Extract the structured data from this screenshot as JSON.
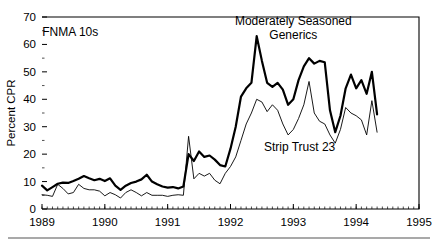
{
  "chart_data": {
    "type": "line",
    "title": "",
    "xlabel": "",
    "ylabel": "Percent CPR",
    "xlim": [
      1989.0,
      1995.0
    ],
    "ylim": [
      0,
      70
    ],
    "yticks": [
      0,
      10,
      20,
      30,
      40,
      50,
      60,
      70
    ],
    "xticks": [
      1989,
      1990,
      1991,
      1992,
      1993,
      1994,
      1995
    ],
    "xtick_labels": [
      "1989",
      "1990",
      "1991",
      "1992",
      "1993",
      "1994",
      "1995"
    ],
    "ytick_labels": [
      "0",
      "10",
      "20",
      "30",
      "40",
      "50",
      "60",
      "70"
    ],
    "grid": false,
    "legend": "annotations-on-plot",
    "minor_ticks": "monthly",
    "annotations": [
      {
        "text": "FNMA 10s",
        "x": 1989.45,
        "y": 63
      },
      {
        "text": "Moderately Seasoned",
        "x": 1993.0,
        "y": 67
      },
      {
        "text": "Generics",
        "x": 1993.0,
        "y": 62
      },
      {
        "text": "Strip Trust 23",
        "x": 1993.1,
        "y": 21
      }
    ],
    "series": [
      {
        "name": "Moderately Seasoned Generics",
        "style": "bold",
        "x": [
          1989.0,
          1989.083,
          1989.167,
          1989.25,
          1989.333,
          1989.417,
          1989.5,
          1989.583,
          1989.667,
          1989.75,
          1989.833,
          1989.917,
          1990.0,
          1990.083,
          1990.167,
          1990.25,
          1990.333,
          1990.417,
          1990.5,
          1990.583,
          1990.667,
          1990.75,
          1990.833,
          1990.917,
          1991.0,
          1991.083,
          1991.167,
          1991.25,
          1991.333,
          1991.417,
          1991.5,
          1991.583,
          1991.667,
          1991.75,
          1991.833,
          1991.917,
          1992.0,
          1992.083,
          1992.167,
          1992.25,
          1992.333,
          1992.417,
          1992.5,
          1992.583,
          1992.667,
          1992.75,
          1992.833,
          1992.917,
          1993.0,
          1993.083,
          1993.167,
          1993.25,
          1993.333,
          1993.417,
          1993.5,
          1993.583,
          1993.667,
          1993.75,
          1993.833,
          1993.917,
          1994.0,
          1994.083,
          1994.167,
          1994.25,
          1994.333
        ],
        "y": [
          8.5,
          6.8,
          8.0,
          9.2,
          9.6,
          9.5,
          10.2,
          11.0,
          12.0,
          11.2,
          10.5,
          11.0,
          10.2,
          11.2,
          8.5,
          7.0,
          8.5,
          9.5,
          10.0,
          10.8,
          12.5,
          10.0,
          9.0,
          8.2,
          7.8,
          8.0,
          7.5,
          8.2,
          20.0,
          17.5,
          21.0,
          19.0,
          19.5,
          18.0,
          16.0,
          15.5,
          22.0,
          30.0,
          41.0,
          44.0,
          46.0,
          63.0,
          54.0,
          46.0,
          44.5,
          46.0,
          43.5,
          38.0,
          40.0,
          47.0,
          52.0,
          55.0,
          53.0,
          54.0,
          53.5,
          36.0,
          28.0,
          34.0,
          44.0,
          49.0,
          44.0,
          47.0,
          42.0,
          50.0,
          34.5
        ]
      },
      {
        "name": "Strip Trust 23",
        "style": "thin",
        "x": [
          1989.0,
          1989.083,
          1989.167,
          1989.25,
          1989.333,
          1989.417,
          1989.5,
          1989.583,
          1989.667,
          1989.75,
          1989.833,
          1989.917,
          1990.0,
          1990.083,
          1990.167,
          1990.25,
          1990.333,
          1990.417,
          1990.5,
          1990.583,
          1990.667,
          1990.75,
          1990.833,
          1990.917,
          1991.0,
          1991.083,
          1991.167,
          1991.25,
          1991.333,
          1991.417,
          1991.5,
          1991.583,
          1991.667,
          1991.75,
          1991.833,
          1991.917,
          1992.0,
          1992.083,
          1992.167,
          1992.25,
          1992.333,
          1992.417,
          1992.5,
          1992.583,
          1992.667,
          1992.75,
          1992.833,
          1992.917,
          1993.0,
          1993.083,
          1993.167,
          1993.25,
          1993.333,
          1993.417,
          1993.5,
          1993.583,
          1993.667,
          1993.75,
          1993.833,
          1993.917,
          1994.0,
          1994.083,
          1994.167,
          1994.25,
          1994.333
        ],
        "y": [
          5.2,
          5.0,
          4.6,
          9.0,
          7.5,
          5.5,
          6.0,
          9.0,
          7.5,
          7.0,
          7.0,
          6.5,
          4.8,
          6.0,
          5.2,
          4.0,
          6.0,
          7.0,
          6.0,
          4.8,
          6.0,
          5.0,
          5.0,
          5.0,
          4.6,
          5.0,
          5.2,
          5.0,
          26.5,
          11.0,
          13.0,
          12.0,
          13.0,
          10.5,
          9.2,
          13.0,
          15.5,
          19.0,
          25.0,
          31.0,
          35.0,
          40.0,
          39.0,
          35.5,
          38.0,
          36.0,
          31.0,
          27.0,
          29.0,
          33.0,
          38.0,
          46.5,
          35.0,
          32.0,
          31.0,
          27.0,
          24.0,
          29.0,
          37.0,
          35.0,
          34.0,
          32.5,
          27.0,
          39.5,
          28.0
        ]
      }
    ]
  }
}
